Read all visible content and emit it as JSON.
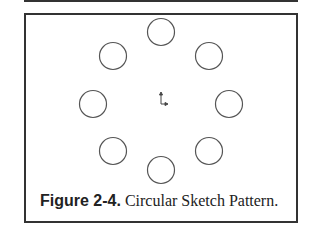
{
  "figure": {
    "label": "Figure 2-4.",
    "title": "Circular Sketch Pattern."
  },
  "pattern": {
    "center": [
      162,
      100
    ],
    "circle_radius": 13.5,
    "stroke_color": "#555555",
    "circles": [
      {
        "cx": 161,
        "cy": 32
      },
      {
        "cx": 209,
        "cy": 56
      },
      {
        "cx": 229,
        "cy": 104
      },
      {
        "cx": 209,
        "cy": 151
      },
      {
        "cx": 161,
        "cy": 170
      },
      {
        "cx": 113,
        "cy": 151
      },
      {
        "cx": 93,
        "cy": 104
      },
      {
        "cx": 113,
        "cy": 56
      }
    ]
  }
}
